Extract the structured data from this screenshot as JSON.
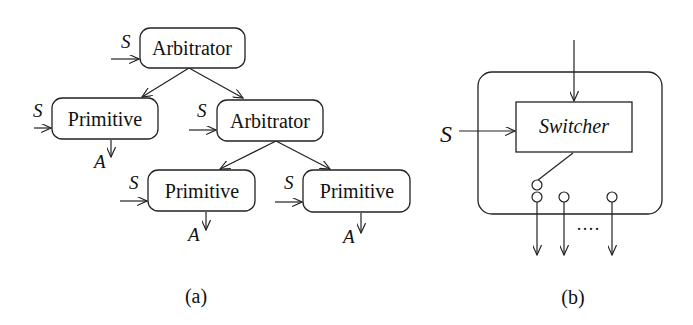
{
  "diagram_a": {
    "caption": "(a)",
    "nodes": [
      {
        "id": "root-arbitrator",
        "label": "Arbitrator",
        "input": "S"
      },
      {
        "id": "left-primitive",
        "label": "Primitive",
        "input": "S",
        "output": "A"
      },
      {
        "id": "mid-arbitrator",
        "label": "Arbitrator",
        "input": "S"
      },
      {
        "id": "bottom-left-primitive",
        "label": "Primitive",
        "input": "S",
        "output": "A"
      },
      {
        "id": "bottom-right-primitive",
        "label": "Primitive",
        "input": "S",
        "output": "A"
      }
    ],
    "edges": [
      [
        "root-arbitrator",
        "left-primitive"
      ],
      [
        "root-arbitrator",
        "mid-arbitrator"
      ],
      [
        "mid-arbitrator",
        "bottom-left-primitive"
      ],
      [
        "mid-arbitrator",
        "bottom-right-primitive"
      ]
    ]
  },
  "diagram_b": {
    "caption": "(b)",
    "switcher_label": "Switcher",
    "input_label": "S",
    "ellipsis": "····"
  }
}
